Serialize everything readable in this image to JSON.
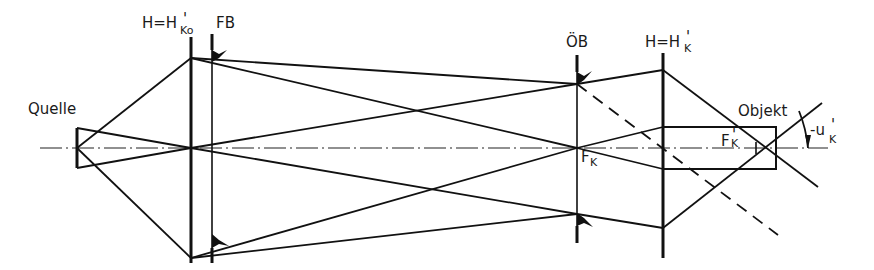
{
  "diagram": {
    "labels": {
      "source": "Quelle",
      "collector_lens_main": "H=H",
      "collector_lens_prime": "'",
      "collector_lens_sub": "Ko",
      "field_stop": "FB",
      "aperture_stop": "ÖB",
      "condenser_lens_main": "H=H",
      "condenser_lens_prime": "'",
      "condenser_lens_sub": "K",
      "focal_point_main": "F",
      "focal_point_sub": "K",
      "focal_point_prime_main": "F",
      "focal_point_prime_prime": "'",
      "focal_point_prime_sub": "K",
      "object": "Objekt",
      "angle_main": "-u",
      "angle_prime": "'",
      "angle_sub": "K"
    },
    "colors": {
      "line": "#111111",
      "background": "#ffffff"
    }
  }
}
